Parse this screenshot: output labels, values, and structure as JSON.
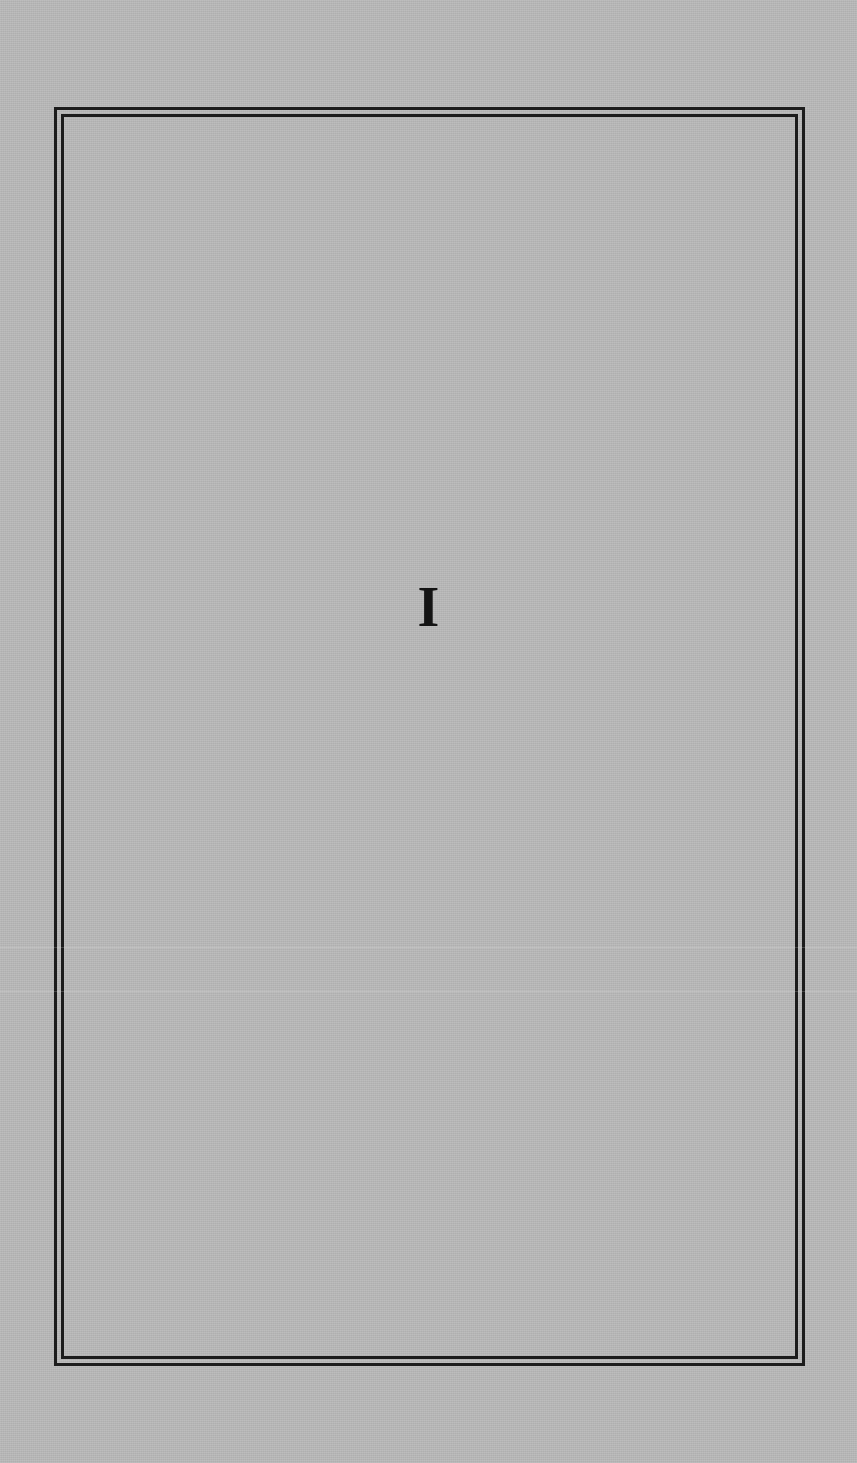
{
  "page": {
    "numeral": "I",
    "colors": {
      "background": "#b9b9b9",
      "frame": "#1c1c1c",
      "text": "#141414"
    }
  }
}
